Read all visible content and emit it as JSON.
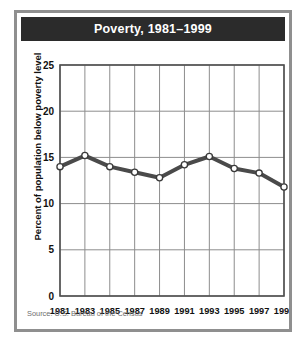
{
  "card": {
    "source_note": "Source: U.S. Bureau of the Census",
    "frame_color": "#8f8f8f",
    "header_bg": "#2b2b2b",
    "header_fg": "#ffffff"
  },
  "chart_data": {
    "type": "line",
    "title": "Poverty, 1981–1999",
    "xlabel": "",
    "ylabel": "Percent of population below poverty level",
    "categories": [
      "1981",
      "1983",
      "1985",
      "1987",
      "1989",
      "1991",
      "1993",
      "1995",
      "1997",
      "1999"
    ],
    "values": [
      14.0,
      15.2,
      14.0,
      13.4,
      12.8,
      14.2,
      15.1,
      13.8,
      13.3,
      11.8
    ],
    "yticks": [
      0,
      5,
      10,
      15,
      20,
      25
    ],
    "ytick_labels": [
      "0",
      "5",
      "10",
      "15",
      "20",
      "25"
    ],
    "ylim": [
      0,
      25
    ],
    "grid": true,
    "legend": "none",
    "series_color": "#4a4a4a",
    "marker_fill": "#ffffff",
    "marker_edge": "#3a3a3a",
    "grid_color": "#8d8d8d",
    "plot_bg": "#ffffff"
  }
}
